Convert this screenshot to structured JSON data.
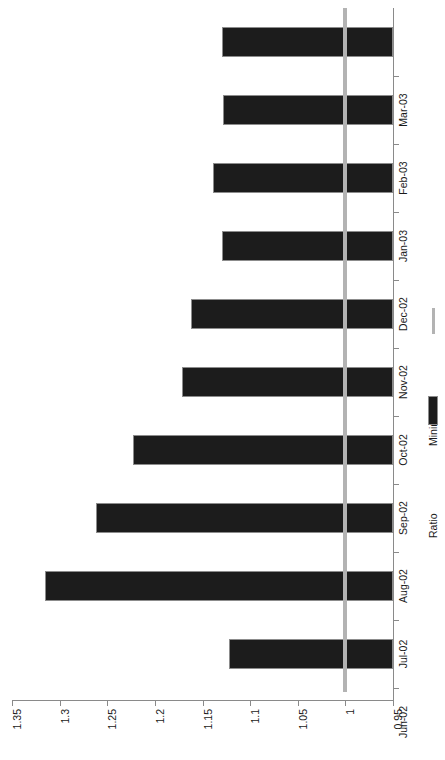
{
  "chart_data": {
    "type": "bar",
    "orientation": "rotated-90",
    "title": "",
    "subtitle": "",
    "xlabel": "",
    "ylabel": "",
    "categories": [
      "Jun-02",
      "Jul-02",
      "Aug-02",
      "Sep-02",
      "Oct-02",
      "Nov-02",
      "Dec-02",
      "Jan-03",
      "Feb-03",
      "Mar-03"
    ],
    "series": [
      {
        "name": "Ratio",
        "type": "bar",
        "color": "#1c1c1c",
        "values": [
          1.122,
          1.315,
          1.262,
          1.223,
          1.172,
          1.162,
          1.13,
          1.139,
          1.129,
          1.13
        ]
      },
      {
        "name": "Minimum",
        "type": "line",
        "color": "#b3b3b3",
        "constant_value": 1.0,
        "values": [
          1.0,
          1.0,
          1.0,
          1.0,
          1.0,
          1.0,
          1.0,
          1.0,
          1.0,
          1.0
        ]
      }
    ],
    "value_axis": {
      "min": 0.95,
      "max": 1.35,
      "tick_step": 0.05,
      "ticks": [
        "1.35",
        "1.3",
        "1.25",
        "1.2",
        "1.15",
        "1.1",
        "1.05",
        "1",
        "0.95"
      ],
      "tick_values": [
        1.35,
        1.3,
        1.25,
        1.2,
        1.15,
        1.1,
        1.05,
        1.0,
        0.95
      ],
      "direction": "descending-left-to-right"
    },
    "ylim": [
      0.95,
      1.35
    ],
    "grid": false,
    "legend_position": "right",
    "legend": [
      {
        "label": "Minimum",
        "marker": "line",
        "color": "#b3b3b3"
      },
      {
        "label": "Ratio",
        "marker": "swatch",
        "color": "#1c1c1c"
      }
    ]
  },
  "colors": {
    "bar": "#1c1c1c",
    "bar_edge": "#8c8c8c",
    "minimum_line": "#b3b3b3",
    "axis": "#8a8a8a",
    "background": "#ffffff",
    "text": "#1a1a1a"
  }
}
